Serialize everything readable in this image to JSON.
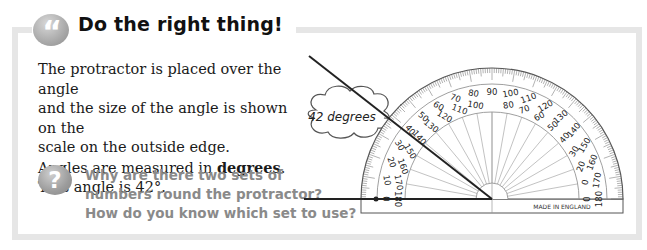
{
  "header": {
    "badge_icon": "quote-icon",
    "badge_glyph": "“",
    "title": "Do the right thing!"
  },
  "body": {
    "lines": [
      "The protractor is placed over the angle",
      "and the size of the angle is shown on the",
      "scale on the outside edge."
    ],
    "degrees_prefix": "Angles are measured in ",
    "degrees_bold": "degrees",
    "degrees_suffix": ".",
    "angle_statement": "This angle is 42°."
  },
  "callout": {
    "icon": "thought-cloud",
    "label": "42 degrees"
  },
  "question": {
    "icon": "question-icon",
    "glyph": "?",
    "lines": [
      "Why are there two sets of",
      "numbers round the protractor?",
      "How do you know which set to use?"
    ]
  },
  "protractor": {
    "outer_scale": [
      "0",
      "10",
      "20",
      "30",
      "40",
      "50",
      "60",
      "70",
      "80",
      "90",
      "100",
      "110",
      "120",
      "130",
      "140",
      "150",
      "160",
      "170",
      "180"
    ],
    "inner_scale": [
      "180",
      "170",
      "160",
      "150",
      "140",
      "130",
      "120",
      "110",
      "100",
      "90",
      "80",
      "70",
      "60",
      "50",
      "40",
      "30",
      "20",
      "10",
      "0"
    ],
    "inner_scale_display": [
      "180",
      "170",
      "160",
      "150",
      "140",
      "130",
      "120",
      "110",
      "100",
      "",
      "80",
      "70",
      "60",
      "50",
      "40",
      "30",
      "20",
      "0",
      "0"
    ],
    "imprint": "MADE IN ENGLAND",
    "measured_angle_deg": 42
  },
  "colors": {
    "frame": "#e6e6e6",
    "badge": "#a9a9a9",
    "question_text": "#8a8a8a",
    "line": "#222222"
  }
}
